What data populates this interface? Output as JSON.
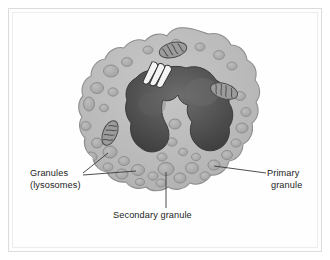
{
  "figure": {
    "labels": {
      "granules_line1": "Granules",
      "granules_line2": "(lysosomes)",
      "primary_line1": "Primary",
      "primary_line2": "granule",
      "secondary": "Secondary granule"
    },
    "structures": [
      {
        "name": "cell-membrane",
        "label": "Cell membrane"
      },
      {
        "name": "cytoplasm",
        "label": "Cytoplasm"
      },
      {
        "name": "nucleus",
        "label": "Multilobed nucleus"
      },
      {
        "name": "golgi-apparatus",
        "label": "Golgi apparatus"
      },
      {
        "name": "mitochondrion",
        "label": "Mitochondrion"
      },
      {
        "name": "granule",
        "label": "Granule"
      }
    ],
    "colors": {
      "background": "#ffffff",
      "frame_border": "#dcdcdc",
      "cytoplasm": "#b9b9b9",
      "cytoplasm_light": "#c6c6c6",
      "membrane_outline": "#8e8e8e",
      "nucleus": "#4a4a4a",
      "nucleus_highlight": "#6a6a6a",
      "nucleus_outline": "#333333",
      "granule_fill": "#adadad",
      "granule_rim": "#8a8a8a",
      "mitochondria_fill": "#9a9a9a",
      "mitochondria_outline": "#4f4f4f",
      "golgi_fill": "#f2f2f2",
      "golgi_outline": "#3a3a3a",
      "leader_line": "#3a3a3a",
      "text": "#1d1d1d"
    },
    "counts": {
      "mitochondria": 3,
      "nucleus_lobes": 3,
      "golgi_stacks": 3
    }
  }
}
